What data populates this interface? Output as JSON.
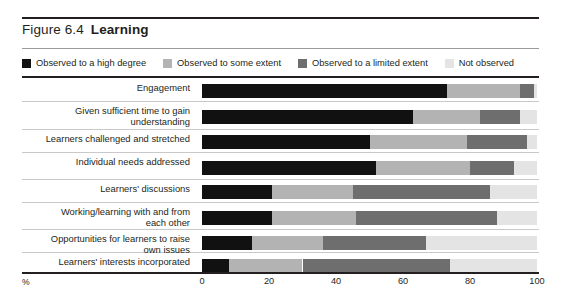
{
  "figure": {
    "number": "Figure 6.4",
    "name": "Learning",
    "axis_unit_label": "%"
  },
  "legend": {
    "items": [
      {
        "label": "Observed to a high degree",
        "color": "#111111",
        "key": "high"
      },
      {
        "label": "Observed to some extent",
        "color": "#b3b3b3",
        "key": "some"
      },
      {
        "label": "Observed to a limited extent",
        "color": "#6e6e6e",
        "key": "limited"
      },
      {
        "label": "Not observed",
        "color": "#e4e4e4",
        "key": "not"
      }
    ]
  },
  "chart_data": {
    "type": "bar",
    "orientation": "horizontal",
    "stacked": true,
    "xlabel": "%",
    "ylabel": "",
    "xlim": [
      0,
      100
    ],
    "xticks": [
      0,
      20,
      40,
      60,
      80,
      100
    ],
    "xticklabels": [
      "0",
      "20",
      "40",
      "60",
      "80",
      "100"
    ],
    "grid": false,
    "legend_position": "top",
    "categories": [
      "Engagement",
      "Given sufficient time to gain understanding",
      "Learners challenged and stretched",
      "Individual needs addressed",
      "Learners' discussions",
      "Working/learning with and from each other",
      "Opportunities for learners to raise own issues",
      "Learners' interests incorporated"
    ],
    "series": [
      {
        "name": "Observed to a high degree",
        "color": "#111111",
        "values": [
          73,
          63,
          50,
          52,
          21,
          21,
          15,
          8
        ]
      },
      {
        "name": "Observed to some extent",
        "color": "#b3b3b3",
        "values": [
          22,
          20,
          29,
          28,
          24,
          25,
          21,
          22
        ]
      },
      {
        "name": "Observed to a limited extent",
        "color": "#6e6e6e",
        "values": [
          4,
          12,
          18,
          13,
          41,
          42,
          31,
          44
        ]
      },
      {
        "name": "Not observed",
        "color": "#e4e4e4",
        "values": [
          1,
          5,
          3,
          7,
          14,
          12,
          33,
          26
        ]
      }
    ]
  },
  "rows": [
    {
      "label": "Engagement"
    },
    {
      "label": "Given sufficient time to gain\nunderstanding"
    },
    {
      "label": "Learners challenged and stretched"
    },
    {
      "label": "Individual needs addressed"
    },
    {
      "label": "Learners' discussions"
    },
    {
      "label": "Working/learning with and from\neach other"
    },
    {
      "label": "Opportunities for learners to raise\nown issues"
    },
    {
      "label": "Learners' interests incorporated"
    }
  ]
}
